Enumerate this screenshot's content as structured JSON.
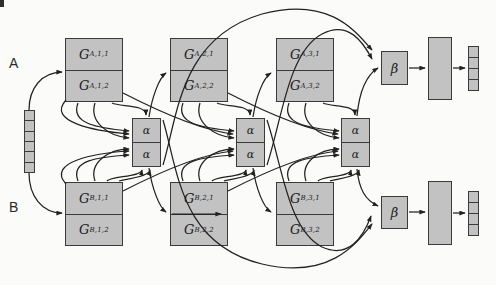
{
  "figure": {
    "background": "#fbfbf9",
    "box_fill": "#c2c2c2",
    "box_border": "#3a3a3a",
    "arrow_color": "#222222"
  },
  "labels": {
    "row_a": "A",
    "row_b": "B"
  },
  "input_vector": {
    "cells": 6
  },
  "output_vectors": {
    "top_cells": 4,
    "bottom_cells": 4
  },
  "g_boxes": [
    {
      "id": "ga1",
      "cells": [
        {
          "main": "G",
          "sub": "A,1,1"
        },
        {
          "main": "G",
          "sub": "A,1,2"
        }
      ]
    },
    {
      "id": "ga2",
      "cells": [
        {
          "main": "G",
          "sub": "A,2,1"
        },
        {
          "main": "G",
          "sub": "A,2,2"
        }
      ]
    },
    {
      "id": "ga3",
      "cells": [
        {
          "main": "G",
          "sub": "A,3,1"
        },
        {
          "main": "G",
          "sub": "A,3,2"
        }
      ]
    },
    {
      "id": "gb1",
      "cells": [
        {
          "main": "G",
          "sub": "B,1,1"
        },
        {
          "main": "G",
          "sub": "B,1,2"
        }
      ]
    },
    {
      "id": "gb2",
      "cells": [
        {
          "main": "G",
          "sub": "B,2,1"
        },
        {
          "main": "G",
          "sub": "B,2,2"
        }
      ]
    },
    {
      "id": "gb3",
      "cells": [
        {
          "main": "G",
          "sub": "B,3,1"
        },
        {
          "main": "G",
          "sub": "B,3,2"
        }
      ]
    }
  ],
  "alpha_stacks": [
    {
      "cells": [
        "α",
        "α"
      ]
    },
    {
      "cells": [
        "α",
        "α"
      ]
    },
    {
      "cells": [
        "α",
        "α"
      ]
    }
  ],
  "beta_boxes": [
    {
      "label": "β"
    },
    {
      "label": "β"
    }
  ],
  "edges": [
    "input-vector -> G_A,1 (left)",
    "input-vector -> G_B,1 (left)",
    "alpha-1 -> G_A,2 (left)",
    "alpha-2 -> G_A,3 (left)",
    "alpha-1 -> G_B,2 (left)",
    "alpha-2 -> G_B,3 (left)",
    "G_B,2,1 internal divider arrow to right edge",
    "G_A,i cells -> alpha-i (left cluster, top arrow)",
    "G_B,i cells -> alpha-i (left cluster, bottom arrows)",
    "previous column G boxes -> alpha-i (crossing curves)",
    "alpha-1 -> beta-top (long top arc)",
    "alpha-2 -> beta-top (top arc)",
    "alpha-3 -> beta-top",
    "alpha-1 -> beta-bottom (long bottom arc)",
    "alpha-2 -> beta-bottom (bottom arc)",
    "alpha-3 -> beta-bottom",
    "beta-top -> hidden-layer-top -> output-vector-top",
    "beta-bottom -> hidden-layer-bottom -> output-vector-bottom"
  ]
}
